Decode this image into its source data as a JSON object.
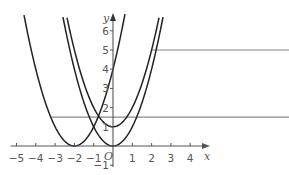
{
  "chart_data": {
    "type": "line",
    "title": "",
    "xlabel": "x",
    "ylabel": "y",
    "origin_label": "O",
    "xlim": [
      -5.3,
      4.7
    ],
    "ylim": [
      -1.2,
      6.8
    ],
    "x_ticks": [
      -5,
      -4,
      -3,
      -2,
      -1,
      1,
      2,
      3,
      4
    ],
    "y_ticks": [
      -1,
      1,
      2,
      3,
      4,
      5,
      6
    ],
    "grid": false,
    "legend": null,
    "series": [
      {
        "name": "y = (x+2)^2",
        "type": "parabola",
        "a": 1,
        "h": -2,
        "k": 0
      },
      {
        "name": "y = x^2",
        "type": "parabola",
        "a": 1,
        "h": 0,
        "k": 0
      },
      {
        "name": "y = x^2 + 1",
        "type": "parabola",
        "a": 1,
        "h": 0,
        "k": 1
      }
    ],
    "horizontal_lines": [
      {
        "y": 5,
        "x_start": 2.0,
        "x_end": 4.7
      },
      {
        "y": 1.5,
        "x_start": -3.2,
        "x_end": 4.7
      }
    ],
    "colors": {
      "curve": "#222222",
      "axis": "#555555",
      "hline": "#888888"
    }
  }
}
